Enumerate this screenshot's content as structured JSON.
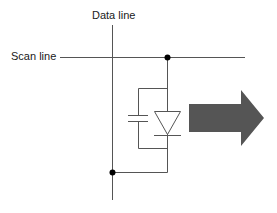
{
  "diagram": {
    "type": "pixel-circuit-schematic",
    "labels": {
      "data_line": "Data line",
      "scan_line": "Scan line"
    },
    "components": [
      "data-line",
      "scan-line",
      "junction-dot-top",
      "junction-dot-bottom",
      "capacitor",
      "diode",
      "output-arrow"
    ],
    "colors": {
      "wire": "#555555",
      "dot": "#000000",
      "arrow": "#555555",
      "text": "#1a1a1a"
    }
  }
}
